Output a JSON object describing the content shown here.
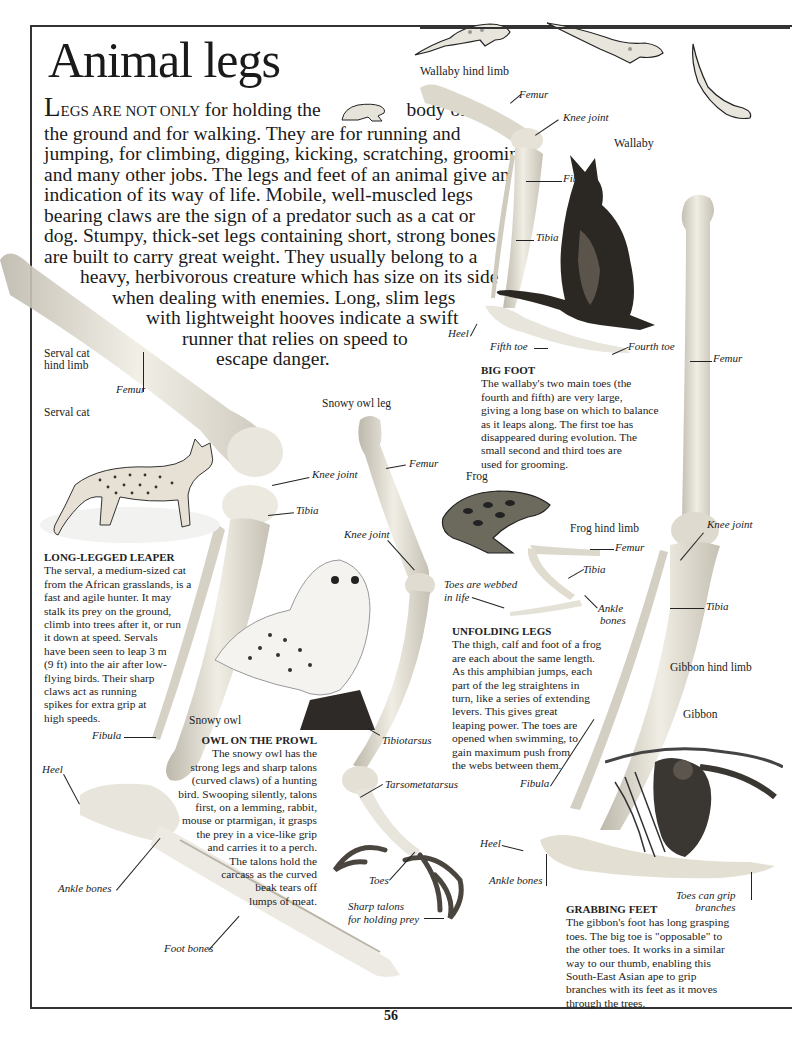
{
  "page": {
    "title": "Animal legs",
    "page_number": "56"
  },
  "intro": {
    "dropcap": "L",
    "smallcaps": "EGS ARE NOT ONLY",
    "lines": [
      " for holding the",
      "body off",
      "the ground and for walking. They are for running and",
      "jumping, for climbing, digging, kicking, scratching, grooming",
      "and many other jobs. The legs and feet of an animal give an",
      "indication of its way of life. Mobile, well-muscled legs",
      "bearing claws are the sign of a predator such as a cat or",
      "dog. Stumpy, thick-set legs containing short, strong bones",
      "are built to carry great weight. They usually belong to a",
      "heavy, herbivorous creature which has size on its side",
      "when dealing with enemies. Long, slim legs",
      "with lightweight hooves indicate a swift",
      "runner that relies on speed to",
      "escape danger."
    ]
  },
  "wallaby": {
    "limb_title": "Wallaby hind limb",
    "animal_label": "Wallaby",
    "labels": {
      "femur": "Femur",
      "knee": "Knee joint",
      "fibula": "Fibula",
      "tibia": "Tibia",
      "heel": "Heel",
      "fifth_toe": "Fifth toe",
      "fourth_toe": "Fourth toe"
    },
    "caption": {
      "heading": "BIG FOOT",
      "lines": [
        "The wallaby's two main toes (the",
        "fourth and fifth) are very large,",
        "giving a long base on which to balance",
        "as it leaps along. The first toe has",
        "disappeared during evolution. The",
        "small second and third toes are",
        "used for grooming."
      ]
    }
  },
  "serval": {
    "limb_title_lines": [
      "Serval cat",
      "hind limb"
    ],
    "animal_label": "Serval cat",
    "labels": {
      "femur": "Femur",
      "knee": "Knee joint",
      "tibia": "Tibia",
      "fibula": "Fibula",
      "heel": "Heel",
      "ankle": "Ankle bones",
      "foot": "Foot bones"
    },
    "caption": {
      "heading": "LONG-LEGGED LEAPER",
      "lines": [
        "The serval, a medium-sized cat",
        "from the African grasslands, is a",
        "fast and agile hunter. It may",
        "stalk its prey on the ground,",
        "climb into trees after it, or run",
        "it down at speed. Servals",
        "have been seen to leap 3 m",
        "(9 ft) into the air after low-",
        "flying birds. Their sharp",
        "claws act as running",
        "spikes for extra grip at",
        "high speeds."
      ]
    }
  },
  "owl": {
    "limb_title": "Snowy owl leg",
    "animal_label": "Snowy owl",
    "labels": {
      "femur": "Femur",
      "knee": "Knee joint",
      "tibiotarsus": "Tibiotarsus",
      "tarsometatarsus": "Tarsometatarsus",
      "toes": "Toes",
      "talons_1": "Sharp talons",
      "talons_2": "for holding prey"
    },
    "caption": {
      "heading": "OWL ON THE PROWL",
      "lines": [
        "The snowy owl has the",
        "strong legs and sharp talons",
        "(curved claws) of a hunting",
        "bird. Swooping silently, talons",
        "first, on a lemming, rabbit,",
        "mouse or ptarmigan, it grasps",
        "the prey in a vice-like grip",
        "and carries it to a perch.",
        "The talons hold the",
        "carcass as the curved",
        "beak tears off",
        "lumps of meat."
      ]
    }
  },
  "frog": {
    "animal_label": "Frog",
    "limb_title": "Frog hind limb",
    "labels": {
      "femur": "Femur",
      "tibia": "Tibia",
      "webbed_1": "Toes are webbed",
      "webbed_2": "in life",
      "ankle_1": "Ankle",
      "ankle_2": "bones"
    },
    "caption": {
      "heading": "UNFOLDING LEGS",
      "lines": [
        "The thigh, calf and foot of a frog",
        "are each about the same length.",
        "As this amphibian jumps, each",
        "part of the leg straightens in",
        "turn, like a series of extending",
        "levers. This gives great",
        "leaping power. The toes are",
        "opened when swimming, to",
        "gain maximum push from",
        "the webs between them."
      ]
    }
  },
  "gibbon": {
    "limb_title": "Gibbon hind limb",
    "animal_label": "Gibbon",
    "labels": {
      "femur": "Femur",
      "knee": "Knee joint",
      "tibia": "Tibia",
      "fibula": "Fibula",
      "heel": "Heel",
      "ankle": "Ankle bones",
      "toes_1": "Toes can grip",
      "toes_2": "branches"
    },
    "caption": {
      "heading": "GRABBING FEET",
      "lines": [
        "The gibbon's foot has long grasping",
        "toes. The big toe is \"opposable\" to",
        "the other toes. It works in a similar",
        "way to our thumb, enabling this",
        "South-East Asian ape to grip",
        "branches with its feet as it moves",
        "through the trees."
      ]
    }
  },
  "colors": {
    "ink": "#1a1a1a",
    "bone": "#e6e2d6",
    "bone_shade": "#c9c4b6",
    "frame": "#333333"
  }
}
